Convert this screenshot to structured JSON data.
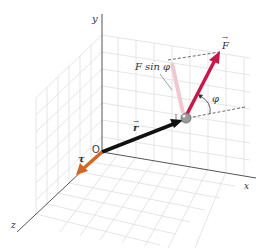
{
  "diagram": {
    "labels": {
      "y_axis": "y",
      "x_axis": "x",
      "z_axis": "z",
      "origin": "O",
      "r_vector": "r",
      "F_vector": "F",
      "tau_vector": "τ",
      "F_sin_phi": "F sin φ",
      "phi": "φ"
    },
    "colors": {
      "force": "#c8174a",
      "position": "#111111",
      "torque": "#d4661f",
      "component": "#f2c9d3",
      "grid": "#dddddd",
      "axis": "#555555"
    }
  }
}
